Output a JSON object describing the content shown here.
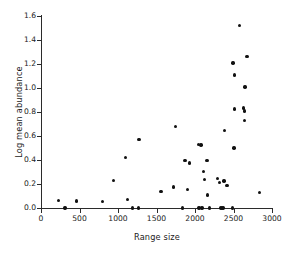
{
  "chart_data": {
    "type": "scatter",
    "title": "",
    "xlabel": "Range size",
    "ylabel": "Log mean abundance",
    "xlim": [
      0,
      3000
    ],
    "ylim": [
      0.0,
      1.6
    ],
    "xticks": [
      0,
      500,
      1000,
      1500,
      2000,
      2500,
      3000
    ],
    "xtick_labels": [
      "0",
      "500",
      "1000",
      "1500",
      "2000",
      "2500",
      "3000"
    ],
    "yticks": [
      0.0,
      0.2,
      0.4,
      0.6,
      0.8,
      1.0,
      1.2,
      1.4,
      1.6
    ],
    "ytick_labels": [
      "0.0",
      "0.2",
      "0.4",
      "0.6",
      "0.8",
      "1.0",
      "1.2",
      "1.4",
      "1.6"
    ],
    "grid": false,
    "legend": null,
    "marker": {
      "shape": "circle",
      "color": "#111111",
      "size": 3.4
    },
    "points": [
      {
        "x": 230,
        "y": 0.065
      },
      {
        "x": 310,
        "y": 0.0
      },
      {
        "x": 460,
        "y": 0.06
      },
      {
        "x": 800,
        "y": 0.055
      },
      {
        "x": 940,
        "y": 0.23
      },
      {
        "x": 1100,
        "y": 0.42
      },
      {
        "x": 1120,
        "y": 0.07
      },
      {
        "x": 1190,
        "y": 0.0
      },
      {
        "x": 1265,
        "y": 0.0
      },
      {
        "x": 1275,
        "y": 0.57
      },
      {
        "x": 1560,
        "y": 0.14
      },
      {
        "x": 1720,
        "y": 0.175
      },
      {
        "x": 1745,
        "y": 0.68
      },
      {
        "x": 1840,
        "y": 0.0
      },
      {
        "x": 1870,
        "y": 0.395
      },
      {
        "x": 1905,
        "y": 0.155
      },
      {
        "x": 1930,
        "y": 0.375
      },
      {
        "x": 2045,
        "y": 0.53
      },
      {
        "x": 2050,
        "y": 0.0
      },
      {
        "x": 2080,
        "y": 0.525
      },
      {
        "x": 2090,
        "y": 0.0
      },
      {
        "x": 2110,
        "y": 0.305
      },
      {
        "x": 2125,
        "y": 0.24
      },
      {
        "x": 2155,
        "y": 0.395
      },
      {
        "x": 2165,
        "y": 0.11
      },
      {
        "x": 2185,
        "y": 0.0
      },
      {
        "x": 2290,
        "y": 0.245
      },
      {
        "x": 2320,
        "y": 0.215
      },
      {
        "x": 2340,
        "y": 0.0
      },
      {
        "x": 2365,
        "y": 0.0
      },
      {
        "x": 2375,
        "y": 0.225
      },
      {
        "x": 2380,
        "y": 0.645
      },
      {
        "x": 2415,
        "y": 0.19
      },
      {
        "x": 2490,
        "y": 0.0
      },
      {
        "x": 2495,
        "y": 1.21
      },
      {
        "x": 2505,
        "y": 0.5
      },
      {
        "x": 2510,
        "y": 0.825
      },
      {
        "x": 2515,
        "y": 1.11
      },
      {
        "x": 2580,
        "y": 1.52
      },
      {
        "x": 2630,
        "y": 0.835
      },
      {
        "x": 2640,
        "y": 0.81
      },
      {
        "x": 2645,
        "y": 0.73
      },
      {
        "x": 2650,
        "y": 1.01
      },
      {
        "x": 2675,
        "y": 1.265
      },
      {
        "x": 2840,
        "y": 0.13
      }
    ]
  }
}
